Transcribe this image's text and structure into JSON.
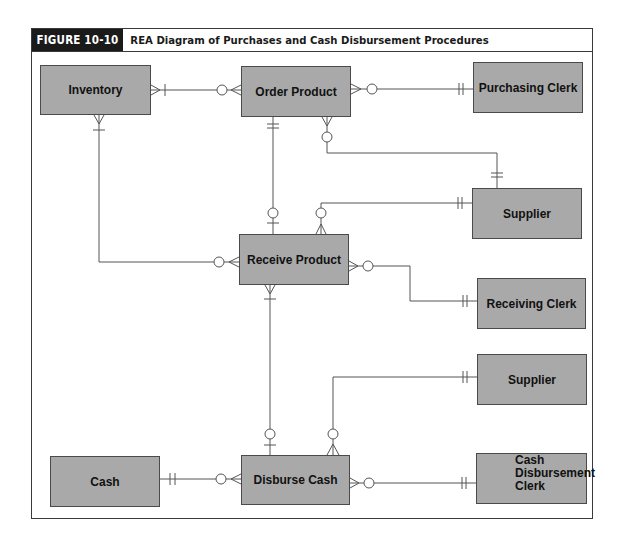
{
  "figure": {
    "label": "FIGURE 10-10",
    "title": "REA Diagram of Purchases and Cash Disbursement Procedures"
  },
  "entities": {
    "inventory": "Inventory",
    "order_product": "Order Product",
    "purchasing_clerk": "Purchasing Clerk",
    "supplier_top": "Supplier",
    "receive_product": "Receive Product",
    "receiving_clerk": "Receiving Clerk",
    "supplier_bottom": "Supplier",
    "cash": "Cash",
    "disburse_cash": "Disburse Cash",
    "cash_disbursement_clerk": {
      "line1": "Cash",
      "line2": "Disbursement",
      "line3": "Clerk"
    }
  },
  "relationships": [
    {
      "from": "Inventory",
      "to": "Order Product",
      "from_card": "one-to-many",
      "to_card": "zero-to-many"
    },
    {
      "from": "Order Product",
      "to": "Purchasing Clerk",
      "from_card": "zero-to-many",
      "to_card": "one-and-only-one"
    },
    {
      "from": "Order Product",
      "to": "Supplier",
      "from_card": "zero-to-many",
      "to_card": "one-and-only-one"
    },
    {
      "from": "Order Product",
      "to": "Receive Product",
      "from_card": "one-and-only-one",
      "to_card": "zero-or-one"
    },
    {
      "from": "Supplier",
      "to": "Receive Product",
      "from_card": "one-and-only-one",
      "to_card": "zero-to-many"
    },
    {
      "from": "Inventory",
      "to": "Receive Product",
      "from_card": "one-to-many",
      "to_card": "zero-to-many"
    },
    {
      "from": "Receive Product",
      "to": "Receiving Clerk",
      "from_card": "zero-to-many",
      "to_card": "one-and-only-one"
    },
    {
      "from": "Receive Product",
      "to": "Disburse Cash",
      "from_card": "one-to-many",
      "to_card": "zero-or-one"
    },
    {
      "from": "Supplier",
      "to": "Disburse Cash",
      "from_card": "one-and-only-one",
      "to_card": "zero-to-many"
    },
    {
      "from": "Cash",
      "to": "Disburse Cash",
      "from_card": "one-and-only-one",
      "to_card": "zero-to-many"
    },
    {
      "from": "Disburse Cash",
      "to": "Cash Disbursement Clerk",
      "from_card": "zero-to-many",
      "to_card": "one-and-only-one"
    }
  ],
  "colors": {
    "entity_fill": "#a9a9a9",
    "line": "#555555",
    "label_bg": "#1a1a1a"
  }
}
